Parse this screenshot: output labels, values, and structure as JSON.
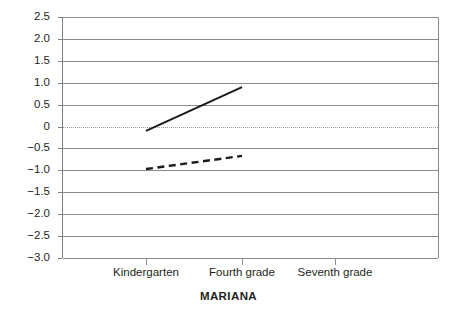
{
  "chart_data": {
    "type": "line",
    "title": "MARIANA",
    "xlabel": "",
    "ylabel": "",
    "categories": [
      "Kindergarten",
      "Fourth grade",
      "Seventh grade"
    ],
    "ylim": [
      -3.0,
      2.5
    ],
    "ytick_labels": [
      "2.5",
      "2.0",
      "1.5",
      "1.0",
      "0.5",
      "0",
      "-0.5",
      "-1.0",
      "-1.5",
      "-2.0",
      "-2.5",
      "-3.0"
    ],
    "ytick_values": [
      2.5,
      2.0,
      1.5,
      1.0,
      0.5,
      0,
      -0.5,
      -1.0,
      -1.5,
      -2.0,
      -2.5,
      -3.0
    ],
    "grid": true,
    "zero_line": "dotted",
    "legend": "none",
    "series": [
      {
        "name": "solid-series",
        "style": "solid",
        "color": "#1a1a1a",
        "x": [
          "Kindergarten",
          "Fourth grade"
        ],
        "values": [
          -0.1,
          0.9
        ]
      },
      {
        "name": "dashed-series",
        "style": "dashed",
        "color": "#1a1a1a",
        "x": [
          "Kindergarten",
          "Fourth grade"
        ],
        "values": [
          -0.97,
          -0.67
        ]
      }
    ]
  },
  "axis": {
    "y_labels": [
      "2.5",
      "2.0",
      "1.5",
      "1.0",
      "0.5",
      "0",
      "-0.5",
      "-1.0",
      "-1.5",
      "-2.0",
      "-2.5",
      "-3.0"
    ],
    "x_labels": [
      "Kindergarten",
      "Fourth grade",
      "Seventh grade"
    ]
  },
  "title": {
    "text": "MARIANA"
  },
  "colors": {
    "grid": "#8a8a8a",
    "zero_grid": "#9a9a9a",
    "series": "#1a1a1a",
    "text": "#231f20",
    "background": "#ffffff"
  }
}
